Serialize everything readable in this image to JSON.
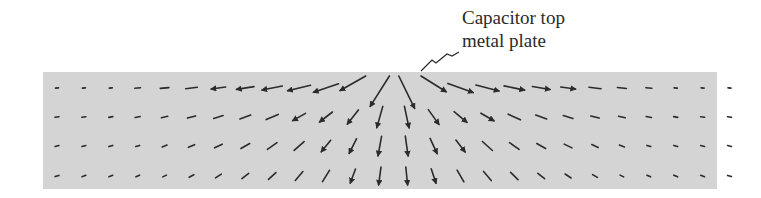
{
  "figure": {
    "annotation": {
      "line1": "Capacitor top",
      "line2": "metal plate"
    },
    "substrate": {
      "x": 43,
      "y": 72,
      "width": 674,
      "height": 117,
      "fill": "#d4d4d4"
    },
    "field": {
      "color": "#2b2b2b",
      "columns": 26,
      "rows": 4,
      "x0": 57,
      "dx": 26.9,
      "row_y": [
        88,
        117,
        146,
        176
      ],
      "center_x": 395
    }
  }
}
